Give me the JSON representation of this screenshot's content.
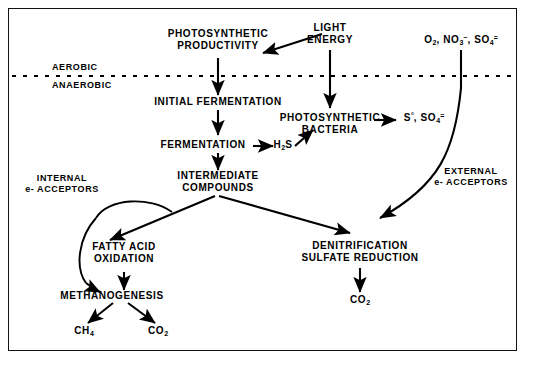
{
  "diagram": {
    "border_color": "#111111",
    "background": "#ffffff",
    "text_color": "#000000",
    "zones": {
      "aerobic_label": "AEROBIC",
      "anaerobic_label": "ANAEROBIC",
      "divider_style": "dotted"
    },
    "nodes": {
      "photosynthetic_productivity": {
        "line1": "PHOTOSYNTHETIC",
        "line2": "PRODUCTIVITY"
      },
      "light_energy": {
        "line1": "LIGHT",
        "line2": "ENERGY"
      },
      "oxidants": {
        "text": "O2, NO3-, SO4="
      },
      "initial_fermentation": {
        "text": "INITIAL FERMENTATION"
      },
      "fermentation": {
        "text": "FERMENTATION"
      },
      "h2s": {
        "text": "H2S"
      },
      "photosynthetic_bacteria": {
        "line1": "PHOTOSYNTHETIC",
        "line2": "BACTERIA"
      },
      "sulfur_products": {
        "text": "S0, SO4="
      },
      "intermediate_compounds": {
        "line1": "INTERMEDIATE",
        "line2": "COMPOUNDS"
      },
      "internal_acceptors": {
        "line1": "INTERNAL",
        "line2": "e- ACCEPTORS"
      },
      "external_acceptors": {
        "line1": "EXTERNAL",
        "line2": "e- ACCEPTORS"
      },
      "fatty_acid_oxidation": {
        "line1": "FATTY ACID",
        "line2": "OXIDATION"
      },
      "methanogenesis": {
        "text": "METHANOGENESIS"
      },
      "methane": {
        "text": "CH4"
      },
      "co2_left": {
        "text": "CO2"
      },
      "denitrification": {
        "line1": "DENITRIFICATION",
        "line2": "SULFATE REDUCTION"
      },
      "co2_right": {
        "text": "CO2"
      }
    },
    "edges": [
      {
        "name": "light-energy-to-photosynthetic-productivity",
        "style": "straight-arrow"
      },
      {
        "name": "light-energy-down-to-photosynthetic-bacteria",
        "style": "straight-arrow"
      },
      {
        "name": "photosynthetic-productivity-to-initial-fermentation",
        "style": "straight-arrow"
      },
      {
        "name": "initial-fermentation-to-fermentation",
        "style": "straight-arrow"
      },
      {
        "name": "fermentation-to-h2s",
        "style": "straight-arrow"
      },
      {
        "name": "h2s-to-photosynthetic-bacteria",
        "style": "straight-arrow"
      },
      {
        "name": "photosynthetic-bacteria-to-sulfur-products",
        "style": "straight-arrow"
      },
      {
        "name": "fermentation-to-intermediate-compounds",
        "style": "straight-arrow"
      },
      {
        "name": "intermediate-compounds-to-fatty-acid-oxidation",
        "style": "straight-arrow"
      },
      {
        "name": "intermediate-compounds-to-denitrification",
        "style": "straight-arrow"
      },
      {
        "name": "internal-acceptors-curve-to-fatty-acid-oxidation",
        "style": "curved"
      },
      {
        "name": "fatty-acid-oxidation-to-methanogenesis",
        "style": "straight-arrow"
      },
      {
        "name": "internal-acceptors-curve-to-methanogenesis",
        "style": "curved-arrow"
      },
      {
        "name": "methanogenesis-to-methane",
        "style": "straight-arrow"
      },
      {
        "name": "methanogenesis-to-co2",
        "style": "straight-arrow"
      },
      {
        "name": "oxidants-down-external-acceptors-to-denitrification",
        "style": "curved-arrow"
      },
      {
        "name": "denitrification-to-co2",
        "style": "straight-arrow"
      }
    ]
  }
}
